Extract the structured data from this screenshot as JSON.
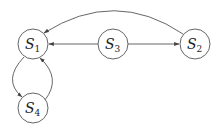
{
  "diagram": {
    "type": "state-graph",
    "nodes": [
      {
        "id": "S1",
        "letter": "S",
        "sub": "1"
      },
      {
        "id": "S2",
        "letter": "S",
        "sub": "2"
      },
      {
        "id": "S3",
        "letter": "S",
        "sub": "3"
      },
      {
        "id": "S4",
        "letter": "S",
        "sub": "4"
      }
    ],
    "edges": [
      {
        "from": "S2",
        "to": "S1",
        "style": "curved-top"
      },
      {
        "from": "S3",
        "to": "S1",
        "style": "straight"
      },
      {
        "from": "S3",
        "to": "S2",
        "style": "straight"
      },
      {
        "from": "S1",
        "to": "S4",
        "style": "curved-left"
      },
      {
        "from": "S4",
        "to": "S1",
        "style": "curved-right"
      }
    ]
  }
}
